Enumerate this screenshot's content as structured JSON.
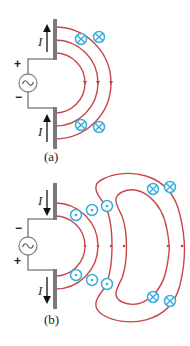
{
  "colors": {
    "field_line": "#c8464a",
    "b_field_symbol": "#3aaed8",
    "antenna": "#7a7a7a",
    "wire": "#888888",
    "text": "#222222"
  },
  "panels": [
    {
      "label": "(a)",
      "current_label": "I",
      "current_direction": "up",
      "source_top_sign": "+",
      "source_bottom_sign": "−",
      "source_symbol": "~",
      "field_symbols": "into-page (⊗)"
    },
    {
      "label": "(b)",
      "current_label": "I",
      "current_direction": "down",
      "source_top_sign": "−",
      "source_bottom_sign": "+",
      "source_symbol": "~",
      "field_symbols_near": "out-of-page (⊙)",
      "field_symbols_far": "into-page (⊗)"
    }
  ]
}
